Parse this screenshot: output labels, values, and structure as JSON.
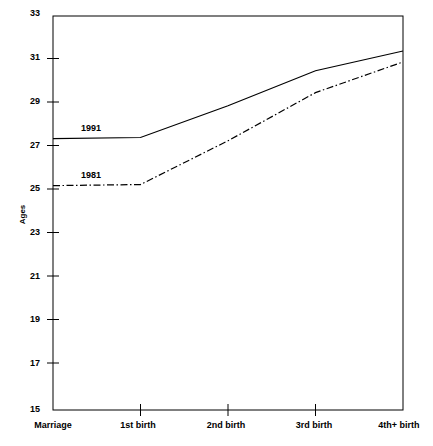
{
  "chart_data": {
    "type": "line",
    "title": "",
    "xlabel": "",
    "ylabel": "Ages",
    "categories": [
      "Marriage",
      "1st birth",
      "2nd birth",
      "3rd birth",
      "4th+ birth"
    ],
    "ylim": [
      15,
      33
    ],
    "yticks": [
      15,
      17,
      19,
      21,
      23,
      25,
      27,
      29,
      31,
      33
    ],
    "grid": false,
    "legend_position": "inline-annotations",
    "series": [
      {
        "name": "1991",
        "style": "solid",
        "color": "#000000",
        "values": [
          27.4,
          27.45,
          28.9,
          30.5,
          31.4
        ]
      },
      {
        "name": "1981",
        "style": "dash-dot",
        "color": "#000000",
        "values": [
          25.25,
          25.3,
          27.3,
          29.5,
          30.9
        ]
      }
    ],
    "annotations": [
      {
        "text": "1991",
        "x_category": "Marriage",
        "value": 28.0
      },
      {
        "text": "1981",
        "x_category": "Marriage",
        "value": 25.9
      }
    ]
  },
  "axis": {
    "y_label": "Ages",
    "y_tick_labels": [
      "33",
      "31",
      "29",
      "27",
      "25",
      "23",
      "21",
      "19",
      "17",
      "15"
    ],
    "x_tick_labels": [
      "Marriage",
      "1st birth",
      "2nd birth",
      "3rd birth",
      "4th+ birth"
    ]
  },
  "series_labels": {
    "upper": "1991",
    "lower": "1981"
  }
}
